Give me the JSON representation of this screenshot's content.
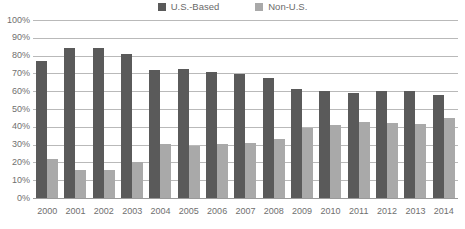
{
  "legend": {
    "position": "top-center",
    "entries": [
      {
        "label": "U.S.-Based",
        "color": "#5a5a5a",
        "swatch_name": "legend-swatch-us-based"
      },
      {
        "label": "Non-U.S.",
        "color": "#a9a9a9",
        "swatch_name": "legend-swatch-non-us"
      }
    ]
  },
  "axis": {
    "y_ticks": [
      "100%",
      "90%",
      "80%",
      "70%",
      "60%",
      "50%",
      "40%",
      "30%",
      "20%",
      "10%",
      "0%"
    ],
    "y_min": 0,
    "y_max": 100,
    "grid": true
  },
  "chart_data": {
    "type": "bar",
    "title": "",
    "subtitle": "",
    "xlabel": "",
    "ylabel": "",
    "ylim": [
      0,
      100
    ],
    "grid": true,
    "legend_position": "top-center",
    "categories": [
      "2000",
      "2001",
      "2002",
      "2003",
      "2004",
      "2005",
      "2006",
      "2007",
      "2008",
      "2009",
      "2010",
      "2011",
      "2012",
      "2013",
      "2014"
    ],
    "series": [
      {
        "name": "U.S.-Based",
        "color": "#5a5a5a",
        "values": [
          77,
          84,
          84.5,
          81,
          72,
          72.5,
          71,
          69.5,
          67.5,
          61.5,
          60,
          59,
          60,
          60,
          58
        ]
      },
      {
        "name": "Non-U.S.",
        "color": "#a9a9a9",
        "values": [
          22,
          16,
          16,
          20,
          30.5,
          29.5,
          30.5,
          31,
          33,
          39.5,
          41,
          42.5,
          42,
          41.5,
          45
        ]
      }
    ]
  }
}
